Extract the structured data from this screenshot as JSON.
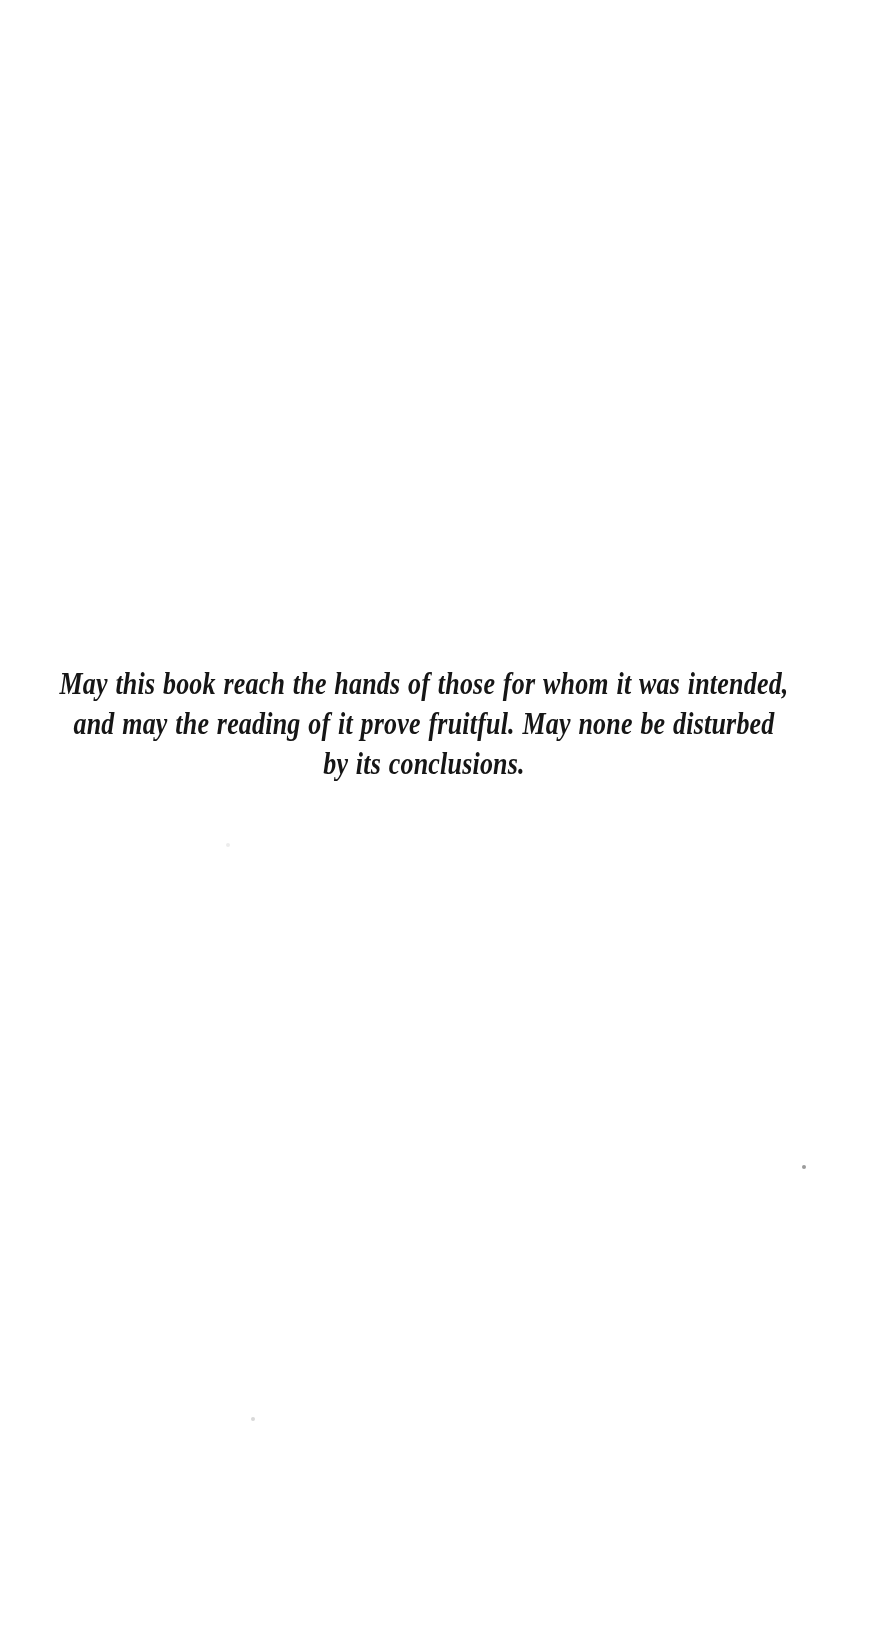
{
  "page": {
    "background_color": "#ffffff",
    "text_color": "#161616"
  },
  "dedication": {
    "lines": [
      "May this book reach the hands of those for whom it was intended,",
      "and may the reading of it prove fruitful. May none be disturbed",
      "by its conclusions."
    ]
  },
  "dust_specks": [
    {
      "x": 802,
      "y": 1165,
      "size": 4,
      "color": "#9b9b9b"
    },
    {
      "x": 251,
      "y": 1417,
      "size": 4,
      "color": "#d9d9d9"
    },
    {
      "x": 226,
      "y": 843,
      "size": 4,
      "color": "#ececec"
    }
  ]
}
